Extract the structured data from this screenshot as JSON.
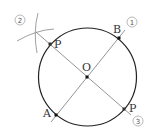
{
  "diagram": {
    "type": "geometry-construction",
    "colors": {
      "circle": "#222222",
      "lines": "#888888",
      "points": "#111111",
      "text": "#333333"
    },
    "circle": {
      "cx": 87.5,
      "cy": 77,
      "r": 49
    },
    "points": [
      {
        "id": "O",
        "label": "O",
        "x": 87,
        "y": 77
      },
      {
        "id": "B",
        "label": "B",
        "x": 119,
        "y": 38
      },
      {
        "id": "A",
        "label": "A",
        "x": 56,
        "y": 115
      },
      {
        "id": "P1",
        "label": "P",
        "x": 50,
        "y": 44
      },
      {
        "id": "P2",
        "label": "P",
        "x": 124,
        "y": 109
      }
    ],
    "step_markers": [
      {
        "label": "1",
        "x": 132,
        "y": 22
      },
      {
        "label": "2",
        "x": 20,
        "y": 20
      },
      {
        "label": "3",
        "x": 138,
        "y": 121
      }
    ]
  }
}
